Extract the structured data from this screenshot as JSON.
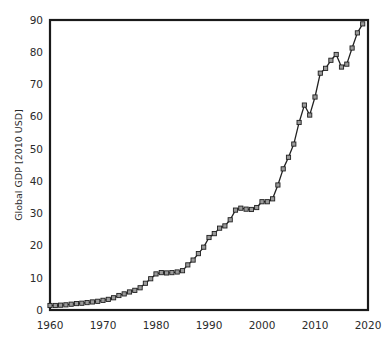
{
  "chart_data": {
    "type": "line",
    "title": "",
    "subtitle": "",
    "xlabel": "",
    "ylabel": "Global GDP [2010 USD]",
    "xlim": [
      1960,
      2020
    ],
    "ylim": [
      0,
      90
    ],
    "xticks": [
      1960,
      1970,
      1980,
      1990,
      2000,
      2010,
      2020
    ],
    "xtick_labels": [
      "1960",
      "1970",
      "1980",
      "1990",
      "2000",
      "2010",
      "2020"
    ],
    "yticks": [
      0,
      10,
      20,
      30,
      40,
      50,
      60,
      70,
      80,
      90
    ],
    "ytick_labels": [
      "0",
      "10",
      "20",
      "30",
      "40",
      "50",
      "60",
      "70",
      "80",
      "90"
    ],
    "grid": "vertical-only",
    "legend": "none",
    "marker": "square",
    "marker_fill": "#9a9a9a",
    "marker_edge": "#1f1f1f",
    "line_color": "#222222",
    "frame_color": "#1a1a1a",
    "gridline_color": "#cfcfcf",
    "background": "#ffffff",
    "x": [
      1960,
      1961,
      1962,
      1963,
      1964,
      1965,
      1966,
      1967,
      1968,
      1969,
      1970,
      1971,
      1972,
      1973,
      1974,
      1975,
      1976,
      1977,
      1978,
      1979,
      1980,
      1981,
      1982,
      1983,
      1984,
      1985,
      1986,
      1987,
      1988,
      1989,
      1990,
      1991,
      1992,
      1993,
      1994,
      1995,
      1996,
      1997,
      1998,
      1999,
      2000,
      2001,
      2002,
      2003,
      2004,
      2005,
      2006,
      2007,
      2008,
      2009,
      2010,
      2011,
      2012,
      2013,
      2014,
      2015,
      2016,
      2017,
      2018,
      2019
    ],
    "values": [
      1.4,
      1.4,
      1.5,
      1.6,
      1.8,
      2.0,
      2.1,
      2.3,
      2.5,
      2.7,
      3.0,
      3.3,
      3.8,
      4.5,
      5.0,
      5.6,
      6.1,
      6.9,
      8.3,
      9.7,
      11.2,
      11.6,
      11.5,
      11.6,
      11.8,
      12.2,
      14.0,
      15.5,
      17.5,
      19.5,
      22.5,
      23.7,
      25.4,
      26.1,
      28.0,
      31.0,
      31.6,
      31.3,
      31.2,
      31.8,
      33.6,
      33.6,
      34.5,
      38.8,
      43.8,
      47.4,
      51.5,
      58.2,
      63.6,
      60.5,
      66.1,
      73.5,
      75.0,
      77.5,
      79.3,
      75.4,
      76.3,
      81.3,
      86.0,
      88.8
    ],
    "annotations": []
  },
  "figure": {
    "canvas_width": 390,
    "canvas_height": 347
  }
}
